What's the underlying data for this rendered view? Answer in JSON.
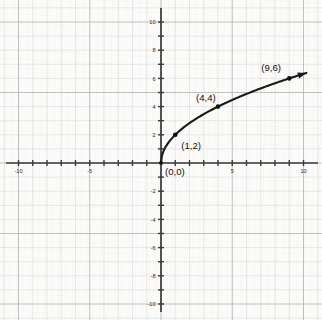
{
  "chart_data": {
    "type": "line",
    "title": "",
    "subtitle": "",
    "xlabel": "",
    "ylabel": "",
    "xlim": [
      -10,
      10
    ],
    "ylim": [
      -10,
      10
    ],
    "grid": true,
    "grid_minor_step": 1,
    "grid_major_step": 5,
    "legend": "none",
    "function": "y = 2*sqrt(x)",
    "domain_drawn": [
      0,
      10.2
    ],
    "arrow_at_end": true,
    "x_tick_labels": [
      "-10",
      "-5",
      "5",
      "10"
    ],
    "x_tick_values": [
      -10,
      -5,
      5,
      10
    ],
    "y_tick_labels": [
      "10",
      "8",
      "6",
      "4",
      "2",
      "-2",
      "-4",
      "-6",
      "-8",
      "-10"
    ],
    "y_tick_values": [
      10,
      8,
      6,
      4,
      2,
      -2,
      -4,
      -6,
      -8,
      -10
    ],
    "x_minor_ticks": [
      -10,
      -9,
      -8,
      -7,
      -6,
      -5,
      -4,
      -3,
      -2,
      -1,
      1,
      2,
      3,
      4,
      5,
      6,
      7,
      8,
      9,
      10
    ],
    "y_minor_ticks": [
      -10,
      -9,
      -8,
      -7,
      -6,
      -5,
      -4,
      -3,
      -2,
      -1,
      1,
      2,
      3,
      4,
      5,
      6,
      7,
      8,
      9,
      10
    ],
    "points": [
      {
        "label": "(0,0)",
        "x": 0,
        "y": 0,
        "label_dx": 4,
        "label_dy": 12
      },
      {
        "label": "(1,2)",
        "x": 1,
        "y": 2,
        "label_dx": 6,
        "label_dy": 14
      },
      {
        "label": "(4,4)",
        "x": 4,
        "y": 4,
        "label_dx": -22,
        "label_dy": -6
      },
      {
        "label": "(9,6)",
        "x": 9,
        "y": 6,
        "label_dx": -28,
        "label_dy": -7
      }
    ],
    "series": [
      {
        "name": "y = 2√x",
        "x": [
          0,
          0.25,
          0.5,
          1,
          1.5,
          2,
          3,
          4,
          5,
          6,
          7,
          8,
          9,
          10
        ],
        "values": [
          0,
          1,
          1.41,
          2,
          2.45,
          2.83,
          3.46,
          4,
          4.47,
          4.9,
          5.29,
          5.66,
          6,
          6.32
        ]
      }
    ],
    "colors": {
      "background": "#fbfbfa",
      "grid_minor": "#dcdcdc",
      "grid_major": "#b9b9b9",
      "axis": "#3a3a3a",
      "curve": "#1a1a1a",
      "point": "#111111",
      "label_text": "#0d0d0d",
      "tick_text": "#2e2e2e"
    }
  }
}
